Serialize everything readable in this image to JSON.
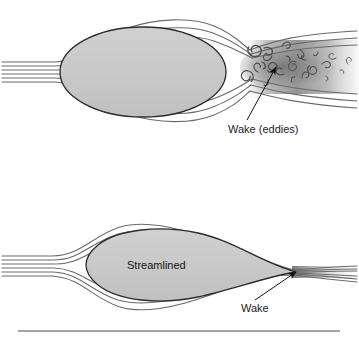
{
  "figure": {
    "title": "",
    "background_color": "#ffffff",
    "width": 359,
    "height": 338
  },
  "colors": {
    "body_fill": "#c9c9c9",
    "body_stroke": "#2b2b2b",
    "streamline_stroke": "#6a6a6a",
    "wake_gray": "#8a8a8a",
    "eddy_stroke": "#4a4a4a",
    "label_text": "#1b1b1b",
    "arrow": "#111111",
    "rule_line": "#4a4a4a"
  },
  "panels": [
    {
      "id": "blunt-body-panel",
      "name": "bluff-body-flow-diagram",
      "body_shape": "ellipse",
      "body_label": "",
      "streamline_count": 5,
      "wake_type": "turbulent-eddies",
      "annotation": {
        "label": "Wake (eddies)",
        "label_x": 228,
        "label_y": 133,
        "arrow_from_x": 247,
        "arrow_from_y": 120,
        "arrow_to_x": 276,
        "arrow_to_y": 67
      }
    },
    {
      "id": "streamlined-body-panel",
      "name": "streamlined-body-flow-diagram",
      "body_shape": "teardrop",
      "body_label": "Streamlined",
      "streamline_count": 5,
      "wake_type": "thin-narrow",
      "annotation": {
        "label": "Wake",
        "label_x": 241,
        "label_y": 312,
        "arrow_from_x": 255,
        "arrow_from_y": 300,
        "arrow_to_x": 296,
        "arrow_to_y": 272
      }
    }
  ],
  "divider": {
    "name": "bottom-rule",
    "y": 331,
    "x1": 18,
    "x2": 340
  }
}
